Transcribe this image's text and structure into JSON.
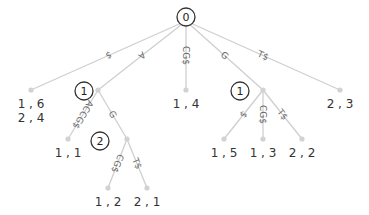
{
  "diagram": {
    "depth_markers": [
      {
        "label": "0",
        "x": 186,
        "y": 17
      },
      {
        "label": "1",
        "x": 84,
        "y": 91
      },
      {
        "label": "2",
        "x": 100,
        "y": 141
      },
      {
        "label": "1",
        "x": 240,
        "y": 91
      }
    ],
    "nodes": [
      {
        "id": "root",
        "x": 186,
        "y": 41
      },
      {
        "id": "n_16",
        "x": 31,
        "y": 90
      },
      {
        "id": "n_A",
        "x": 98,
        "y": 90
      },
      {
        "id": "n_14",
        "x": 186,
        "y": 90
      },
      {
        "id": "n_G",
        "x": 263,
        "y": 90
      },
      {
        "id": "n_23",
        "x": 340,
        "y": 90
      },
      {
        "id": "n_11",
        "x": 68,
        "y": 139
      },
      {
        "id": "n_AG",
        "x": 127,
        "y": 139
      },
      {
        "id": "n_12",
        "x": 108,
        "y": 188
      },
      {
        "id": "n_21",
        "x": 147,
        "y": 188
      },
      {
        "id": "n_15",
        "x": 224,
        "y": 139
      },
      {
        "id": "n_13",
        "x": 263,
        "y": 139
      },
      {
        "id": "n_22",
        "x": 302,
        "y": 139
      }
    ],
    "edges": [
      {
        "from": "root",
        "to": "n_16",
        "label": "$"
      },
      {
        "from": "root",
        "to": "n_A",
        "label": "A"
      },
      {
        "from": "root",
        "to": "n_14",
        "label": "CG$"
      },
      {
        "from": "root",
        "to": "n_G",
        "label": "G"
      },
      {
        "from": "root",
        "to": "n_23",
        "label": "T$"
      },
      {
        "from": "n_A",
        "to": "n_11",
        "label": "ACCG$"
      },
      {
        "from": "n_A",
        "to": "n_AG",
        "label": "G"
      },
      {
        "from": "n_AG",
        "to": "n_12",
        "label": "CG$"
      },
      {
        "from": "n_AG",
        "to": "n_21",
        "label": "T$"
      },
      {
        "from": "n_G",
        "to": "n_15",
        "label": "$"
      },
      {
        "from": "n_G",
        "to": "n_13",
        "label": "CG$"
      },
      {
        "from": "n_G",
        "to": "n_22",
        "label": "T$"
      }
    ],
    "leaves": [
      {
        "node": "n_16",
        "lines": [
          "1 , 6",
          "2 , 4"
        ]
      },
      {
        "node": "n_14",
        "lines": [
          "1 , 4"
        ]
      },
      {
        "node": "n_23",
        "lines": [
          "2 , 3"
        ]
      },
      {
        "node": "n_11",
        "lines": [
          "1 , 1"
        ]
      },
      {
        "node": "n_12",
        "lines": [
          "1 , 2"
        ]
      },
      {
        "node": "n_21",
        "lines": [
          "2 , 1"
        ]
      },
      {
        "node": "n_15",
        "lines": [
          "1 , 5"
        ]
      },
      {
        "node": "n_13",
        "lines": [
          "1 , 3"
        ]
      },
      {
        "node": "n_22",
        "lines": [
          "2 , 2"
        ]
      }
    ],
    "colors": {
      "edge": "#cfcfcf",
      "node": "#d2d2d2",
      "text": "#333333"
    }
  }
}
